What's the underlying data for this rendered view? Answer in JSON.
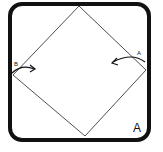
{
  "diagram": {
    "step_label": "A",
    "fold_markers": [
      {
        "label": "B",
        "direction": "right",
        "position": "left-corner"
      },
      {
        "label": "A",
        "direction": "left",
        "position": "right-corner"
      }
    ],
    "colors": {
      "stroke": "#111111",
      "background": "#ffffff"
    }
  }
}
